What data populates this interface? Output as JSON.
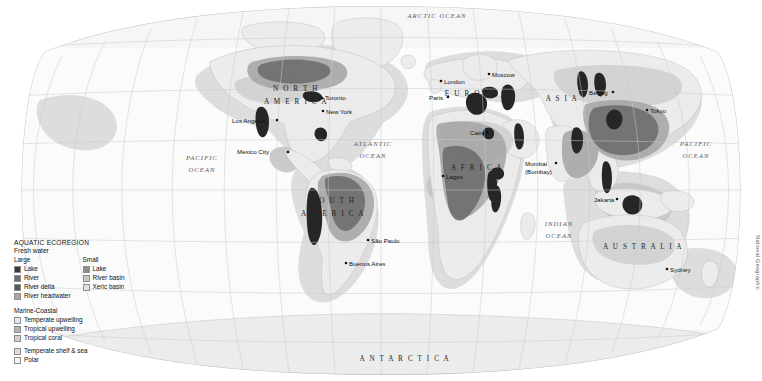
{
  "credit": "National Geographic",
  "legend": {
    "title": "AQUATIC ECOREGION",
    "subtitle": "Fresh water",
    "large_heading": "Large",
    "small_heading": "Small",
    "marine_heading": "Marine-Coastal",
    "large_items": [
      {
        "label": "Lake",
        "color": "#3a3a3a"
      },
      {
        "label": "River",
        "color": "#6e6e6e"
      },
      {
        "label": "River delta",
        "color": "#585858"
      },
      {
        "label": "River headwater",
        "color": "#a9a9a9"
      }
    ],
    "small_items": [
      {
        "label": "Lake",
        "color": "#8d8d8d"
      },
      {
        "label": "River basin",
        "color": "#c8c8c8"
      },
      {
        "label": "Xeric basin",
        "color": "#e2e2e2"
      }
    ],
    "marine_items": [
      {
        "label": "Temperate upwelling",
        "color": "#e8e8e8"
      },
      {
        "label": "Tropical upwelling",
        "color": "#b4b4b4"
      },
      {
        "label": "Tropical coral",
        "color": "#cfcfcf"
      }
    ],
    "marine_items2": [
      {
        "label": "Temperate shelf & sea",
        "color": "#dddddd"
      },
      {
        "label": "Polar",
        "color": "#f4f4f4"
      }
    ]
  },
  "map": {
    "continents": [
      {
        "name": "NORTH AMERICA",
        "lines": [
          "N O R T H",
          "A M E R I C A"
        ],
        "x": 296,
        "y": 91,
        "dy": 13
      },
      {
        "name": "SOUTH AMERICA",
        "lines": [
          "S O U T H",
          "A M E R I C A"
        ],
        "x": 333,
        "y": 203,
        "dy": 13
      },
      {
        "name": "EUROPE",
        "lines": [
          "E U R O P E"
        ],
        "x": 472,
        "y": 96,
        "dy": 0
      },
      {
        "name": "AFRICA",
        "lines": [
          "A F R I C A"
        ],
        "x": 477,
        "y": 170,
        "dy": 0
      },
      {
        "name": "ASIA",
        "lines": [
          "A S I A"
        ],
        "x": 562,
        "y": 101,
        "dy": 0
      },
      {
        "name": "AUSTRALIA",
        "lines": [
          "A U S T R A L I A"
        ],
        "x": 643,
        "y": 249,
        "dy": 0
      },
      {
        "name": "ANTARCTICA",
        "lines": [
          "A N T A R C T I C A"
        ],
        "x": 405,
        "y": 361,
        "dy": 0
      }
    ],
    "oceans": [
      {
        "name": "ARCTIC OCEAN",
        "lines": [
          "ARCTIC OCEAN"
        ],
        "x": 437,
        "y": 18,
        "dy": 0
      },
      {
        "name": "PACIFIC OCEAN",
        "lines": [
          "PACIFIC",
          "OCEAN"
        ],
        "x": 202,
        "y": 160,
        "dy": 12
      },
      {
        "name": "ATLANTIC OCEAN",
        "lines": [
          "ATLANTIC",
          "OCEAN"
        ],
        "x": 373,
        "y": 146,
        "dy": 12
      },
      {
        "name": "INDIAN OCEAN",
        "lines": [
          "INDIAN",
          "OCEAN"
        ],
        "x": 559,
        "y": 226,
        "dy": 12
      },
      {
        "name": "PACIFIC OCEAN 2",
        "lines": [
          "PACIFIC",
          "OCEAN"
        ],
        "x": 696,
        "y": 146,
        "dy": 12
      }
    ],
    "cities": [
      {
        "name": "Los Angeles",
        "label": "Los Angeles",
        "dx": 232,
        "dy": 123,
        "px": 277,
        "py": 120,
        "anchor": "start"
      },
      {
        "name": "Mexico City",
        "label": "Mexico City",
        "dx": 237,
        "dy": 154,
        "px": 288,
        "py": 152,
        "anchor": "start"
      },
      {
        "name": "Toronto",
        "label": "Toronto",
        "dx": 325,
        "dy": 100,
        "px": 322,
        "py": 98,
        "anchor": "start"
      },
      {
        "name": "New York",
        "label": "New York",
        "dx": 326,
        "dy": 114,
        "px": 323,
        "py": 111,
        "anchor": "start"
      },
      {
        "name": "Sao Paulo",
        "label": "São Paulo",
        "dx": 371,
        "dy": 243,
        "px": 368,
        "py": 240,
        "anchor": "start"
      },
      {
        "name": "Buenos Aires",
        "label": "Buenos Aires",
        "dx": 349,
        "dy": 266,
        "px": 346,
        "py": 263,
        "anchor": "start"
      },
      {
        "name": "London",
        "label": "London",
        "dx": 444,
        "dy": 84,
        "px": 441,
        "py": 81,
        "anchor": "start"
      },
      {
        "name": "Paris",
        "label": "Paris",
        "dx": 429,
        "dy": 100,
        "px": 448,
        "py": 97,
        "anchor": "start"
      },
      {
        "name": "Moscow",
        "label": "Moscow",
        "dx": 492,
        "dy": 77,
        "px": 489,
        "py": 74,
        "anchor": "start"
      },
      {
        "name": "Cairo",
        "label": "Cairo",
        "dx": 470,
        "dy": 135,
        "px": 487,
        "py": 132,
        "anchor": "start"
      },
      {
        "name": "Lagos",
        "label": "Lagos",
        "dx": 446,
        "dy": 179,
        "px": 443,
        "py": 176,
        "anchor": "start"
      },
      {
        "name": "Mumbai (Bombay)",
        "label": "Mumbai",
        "dx": 525,
        "dy": 166,
        "px": 556,
        "py": 163,
        "anchor": "start"
      },
      {
        "name": "Mumbai line2",
        "label": "(Bombay)",
        "dx": 525,
        "dy": 174,
        "px": -1,
        "py": -1,
        "anchor": "start"
      },
      {
        "name": "Beijing",
        "label": "Beijing",
        "dx": 589,
        "dy": 95,
        "px": 613,
        "py": 92,
        "anchor": "start"
      },
      {
        "name": "Tokyo",
        "label": "Tokyo",
        "dx": 650,
        "dy": 113,
        "px": 647,
        "py": 110,
        "anchor": "start"
      },
      {
        "name": "Jakarta",
        "label": "Jakarta",
        "dx": 594,
        "dy": 202,
        "px": 617,
        "py": 199,
        "anchor": "start"
      },
      {
        "name": "Sydney",
        "label": "Sydney",
        "dx": 670,
        "dy": 272,
        "px": 667,
        "py": 269,
        "anchor": "start"
      }
    ]
  },
  "colors": {
    "ocean": "#fbfbfb",
    "land": "#ececec",
    "land_stroke": "#c0c0c0",
    "graticule": "#cfcfcf",
    "globe_edge": "#b8b8b8",
    "shelf": "#dcdcdc",
    "upwelling": "#b9b9b9",
    "basin_dark": "#8f8f8f",
    "basin_mid": "#a8a8a8",
    "river_dark": "#3a3a3a",
    "polar": "#f6f6f6"
  }
}
